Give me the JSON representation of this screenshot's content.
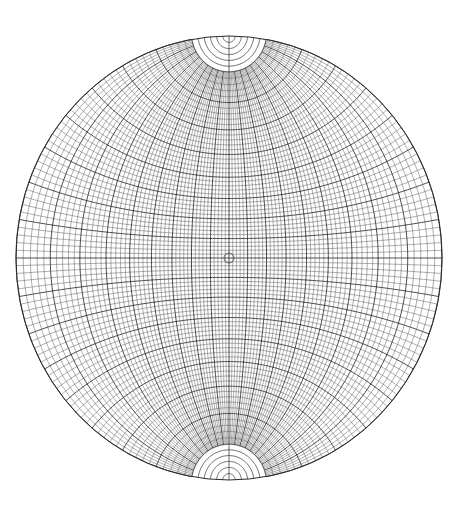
{
  "diagram": {
    "type": "stereographic-net",
    "center": {
      "x": 229,
      "y": 258
    },
    "radius_x": 213,
    "radius_y": 222,
    "grid_step_deg": 2,
    "major_every_deg": 10,
    "polar_cap_deg": 10,
    "polar_rings": 5,
    "center_marker_radius": 5,
    "colors": {
      "background": "#ffffff",
      "line_minor": "#4a4a4a",
      "line_major": "#1e1e1e"
    }
  }
}
